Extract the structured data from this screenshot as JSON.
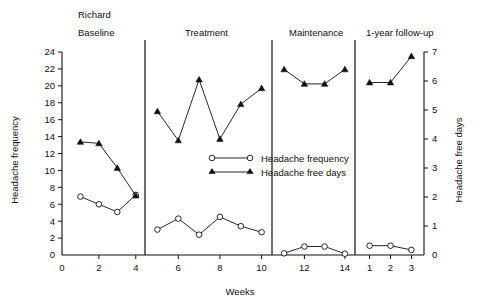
{
  "chart_data": {
    "type": "line",
    "title": "Richard",
    "xlabel": "Weeks",
    "ylabel": "Headache frequency",
    "y2label": "Headache free days",
    "ylim": [
      0,
      24
    ],
    "y2lim": [
      0,
      7
    ],
    "grid": false,
    "legend_position": "center",
    "y_ticks": [
      0,
      2,
      4,
      6,
      8,
      10,
      12,
      14,
      16,
      18,
      20,
      22,
      24
    ],
    "y2_ticks": [
      0,
      1,
      2,
      3,
      4,
      5,
      6,
      7
    ],
    "phases": [
      {
        "label": "Baseline",
        "x_ticks": [
          2,
          4
        ],
        "x_tick_labels": [
          "2",
          "4"
        ],
        "x_domain": [
          0,
          4.5
        ],
        "weeks": [
          1,
          2,
          3,
          4
        ],
        "headache_frequency": [
          6.9,
          6.0,
          5.1,
          7.1
        ],
        "headache_free_days": [
          3.9,
          3.85,
          3.0,
          2.05
        ]
      },
      {
        "label": "Treatment",
        "x_ticks": [
          6,
          8,
          10
        ],
        "x_tick_labels": [
          "6",
          "8",
          "10"
        ],
        "x_domain": [
          4.5,
          10.5
        ],
        "weeks": [
          5,
          6,
          7,
          8,
          9,
          10
        ],
        "headache_frequency": [
          3.0,
          4.3,
          2.4,
          4.5,
          3.4,
          2.7
        ],
        "headache_free_days": [
          4.95,
          3.95,
          6.05,
          4.0,
          5.2,
          5.75
        ]
      },
      {
        "label": "Maintenance",
        "x_ticks": [
          12,
          14
        ],
        "x_tick_labels": [
          "12",
          "14"
        ],
        "x_domain": [
          10.5,
          14.5
        ],
        "weeks": [
          11,
          12,
          13,
          14
        ],
        "headache_frequency": [
          0.2,
          1.0,
          1.0,
          0.15
        ],
        "headache_free_days": [
          6.4,
          5.9,
          5.9,
          6.4
        ]
      },
      {
        "label": "1-year follow-up",
        "x_ticks": [
          1,
          2,
          3
        ],
        "x_tick_labels": [
          "1",
          "2",
          "3"
        ],
        "x_domain": [
          0.4,
          3.6
        ],
        "weeks": [
          1,
          2,
          3
        ],
        "headache_frequency": [
          1.1,
          1.1,
          0.6
        ],
        "headache_free_days": [
          5.95,
          5.95,
          6.85
        ]
      }
    ],
    "series": [
      {
        "name": "Headache frequency",
        "marker": "open-circle",
        "axis": "left"
      },
      {
        "name": "Headache free days",
        "marker": "filled-triangle",
        "axis": "right"
      }
    ],
    "legend": [
      {
        "label": "Headache frequency",
        "marker": "open-circle"
      },
      {
        "label": "Headache free days",
        "marker": "filled-triangle"
      }
    ],
    "x_zero_label": "0",
    "y2_zero_label": "0",
    "colors": {
      "ink": "#111111",
      "background": "#ffffff"
    }
  }
}
